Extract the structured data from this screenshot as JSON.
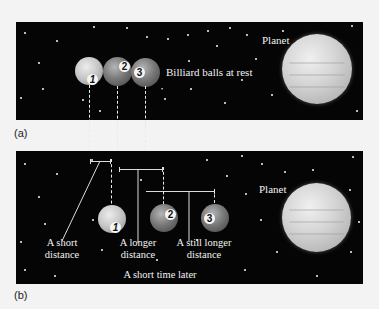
{
  "panel_a": {
    "label": "(a)",
    "planet_label": "Planet",
    "balls_label": "Billiard balls at rest",
    "balls": [
      {
        "number": "1",
        "shade": "light"
      },
      {
        "number": "2",
        "shade": "dark"
      },
      {
        "number": "3",
        "shade": "dark"
      }
    ]
  },
  "panel_b": {
    "label": "(b)",
    "planet_label": "Planet",
    "balls": [
      {
        "number": "1",
        "shade": "light"
      },
      {
        "number": "2",
        "shade": "dark"
      },
      {
        "number": "3",
        "shade": "dark"
      }
    ],
    "distance_labels": {
      "short": {
        "line1": "A short",
        "line2": "distance"
      },
      "longer": {
        "line1": "A longer",
        "line2": "distance"
      },
      "still_longer": {
        "line1": "A still longer",
        "line2": "distance"
      }
    },
    "caption": "A short time later"
  },
  "colors": {
    "space": "#050505",
    "page": "#f3f3f3",
    "ball_light": "#c9c9c9",
    "ball_dark": "#7a7a7a",
    "planet": "#d6d6d6"
  }
}
